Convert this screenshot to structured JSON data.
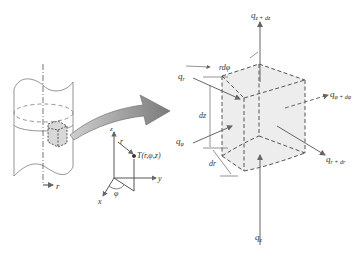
{
  "diagram": {
    "cylinder": {
      "radial_axis_label": "r"
    },
    "coordinate_system": {
      "axes": [
        "z",
        "y",
        "x"
      ],
      "radius_label": "r",
      "angle_label": "φ",
      "point_label": "T(r,φ,z)"
    },
    "element": {
      "dimension_labels": {
        "arc": "rdφ",
        "height": "dz",
        "radial": "dr"
      },
      "fluxes": {
        "q_r": "q",
        "q_r_sub": "r",
        "q_phi": "q",
        "q_phi_sub": "φ",
        "q_z": "q",
        "q_z_sub": "z",
        "q_z_dz": "q",
        "q_z_dz_sub": "z + dz",
        "q_phi_dphi": "q",
        "q_phi_dphi_sub": "φ + dφ",
        "q_r_dr": "q",
        "q_r_dr_sub": "r + dr"
      }
    },
    "colors": {
      "line": "#555555",
      "fill": "#ededed",
      "arrow": "#777777"
    }
  }
}
